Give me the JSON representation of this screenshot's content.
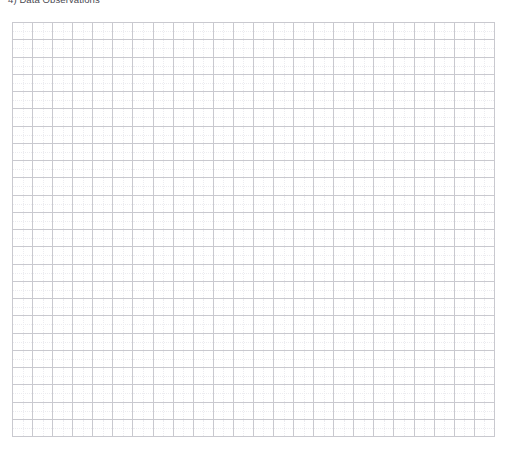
{
  "page": {
    "background_color": "#ffffff",
    "width": 506,
    "height": 451
  },
  "caption": {
    "text": "4) Data Observations",
    "color": "#4a4a52",
    "clipped_at_top": true
  },
  "grid": {
    "columns": 24,
    "rows": 24,
    "cell_width_px": 20.1,
    "cell_height_px": 17.3,
    "line_color": "#c9c9cf",
    "subdivision_line_color": "#ececf0",
    "subdivision_style": "dotted",
    "fill_color": "#ffffff",
    "empty": true,
    "cells": []
  },
  "chart_data": {
    "type": "table",
    "title": "4) Data Observations",
    "xlabel": "",
    "ylabel": "",
    "columns": 24,
    "rows": 24,
    "grid": true,
    "legend": null,
    "categories": [],
    "values": [],
    "annotations": [],
    "note": "Blank graph-paper style observation grid; no data has been entered in any cell."
  }
}
